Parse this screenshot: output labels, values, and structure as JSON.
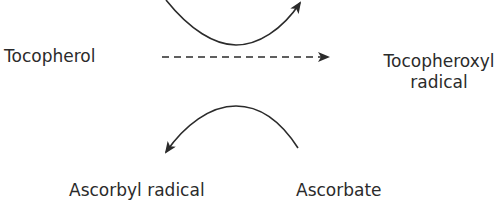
{
  "diagram": {
    "nodes": {
      "tocopherol": "Tocopherol",
      "tocopheroxyl_line1": "Tocopheroxyl",
      "tocopheroxyl_line2": "radical",
      "ascorbyl_radical": "Ascorbyl radical",
      "ascorbate": "Ascorbate"
    },
    "edges": [
      {
        "from": "Tocopherol",
        "to": "Tocopheroxyl radical",
        "style": "dashed"
      },
      {
        "from": "curve-top",
        "direction": "left-to-right",
        "style": "solid"
      },
      {
        "from": "Ascorbate",
        "to": "Ascorbyl radical",
        "style": "solid-curve"
      }
    ],
    "colors": {
      "line": "#2b2b2b",
      "text": "#2b2b2b"
    }
  }
}
